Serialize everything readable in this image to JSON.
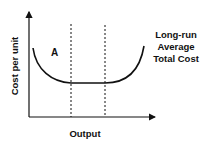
{
  "diagram": {
    "title": "Long-run Average Total Cost",
    "curve_label_lines": [
      "Long-run",
      "Average",
      "Total Cost"
    ],
    "region_label": "A",
    "x_axis_label": "Output",
    "y_axis_label": "Cost per unit",
    "colors": {
      "line": "#111111",
      "background": "#ffffff"
    }
  }
}
